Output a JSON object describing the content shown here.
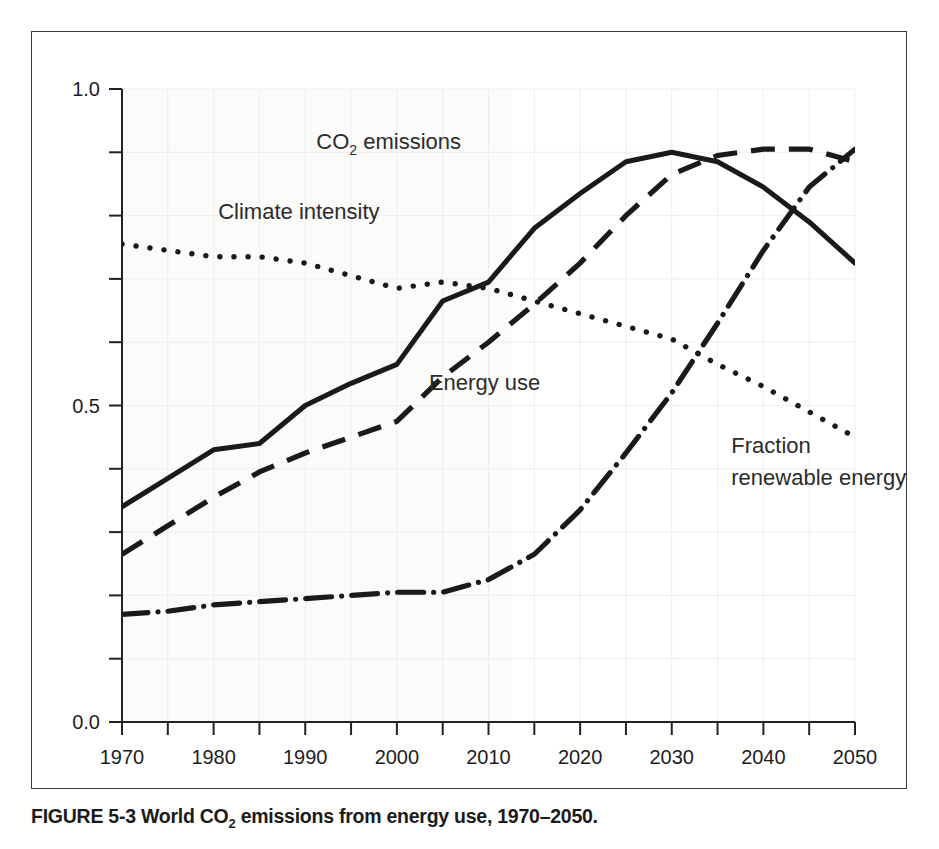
{
  "figure": {
    "caption_prefix": "FIGURE 5-3 World CO",
    "caption_sub": "2",
    "caption_suffix": " emissions from energy use, 1970–2050.",
    "caption_full": "FIGURE 5-3 World CO2 emissions from energy use, 1970–2050."
  },
  "chart_data": {
    "type": "line",
    "title": "",
    "xlabel": "",
    "ylabel": "",
    "xlim": [
      1970,
      2050
    ],
    "ylim": [
      0.0,
      1.0
    ],
    "grid": true,
    "legend_position": "inline-annotations",
    "x_ticks_major": [
      1970,
      1980,
      1990,
      2000,
      2010,
      2020,
      2030,
      2040,
      2050
    ],
    "x_tick_labels": [
      "1970",
      "1980",
      "1990",
      "2000",
      "2010",
      "2020",
      "2030",
      "2040",
      "2050"
    ],
    "x_ticks_minor": [
      1975,
      1985,
      1995,
      2005,
      2015,
      2025,
      2035,
      2045
    ],
    "y_ticks_major": [
      0.0,
      0.5,
      1.0
    ],
    "y_tick_labels": [
      "0.0",
      "0.5",
      "1.0"
    ],
    "y_ticks_minor": [
      0.1,
      0.2,
      0.3,
      0.4,
      0.6,
      0.7,
      0.8,
      0.9
    ],
    "x": [
      1970,
      1975,
      1980,
      1985,
      1990,
      1995,
      2000,
      2005,
      2010,
      2015,
      2020,
      2025,
      2030,
      2035,
      2040,
      2045,
      2050
    ],
    "series": [
      {
        "name": "CO2 emissions",
        "label": "CO₂ emissions",
        "style": "solid",
        "color": "#1a1a1a",
        "values": [
          0.34,
          0.385,
          0.43,
          0.44,
          0.5,
          0.535,
          0.565,
          0.665,
          0.695,
          0.78,
          0.835,
          0.885,
          0.9,
          0.885,
          0.845,
          0.79,
          0.725
        ]
      },
      {
        "name": "Energy use",
        "label": "Energy use",
        "style": "dashed",
        "color": "#1a1a1a",
        "values": [
          0.265,
          0.31,
          0.355,
          0.395,
          0.425,
          0.45,
          0.475,
          0.545,
          0.6,
          0.66,
          0.725,
          0.8,
          0.865,
          0.895,
          0.905,
          0.905,
          0.885
        ]
      },
      {
        "name": "Climate intensity",
        "label": "Climate intensity",
        "style": "dotted",
        "color": "#1a1a1a",
        "values": [
          0.755,
          0.745,
          0.735,
          0.735,
          0.725,
          0.705,
          0.685,
          0.695,
          0.685,
          0.665,
          0.645,
          0.625,
          0.605,
          0.565,
          0.53,
          0.49,
          0.45
        ]
      },
      {
        "name": "Fraction renewable energy",
        "label_line1": "Fraction",
        "label_line2": "renewable energy",
        "style": "dash-dot",
        "color": "#1a1a1a",
        "values": [
          0.17,
          0.175,
          0.185,
          0.19,
          0.195,
          0.2,
          0.205,
          0.205,
          0.225,
          0.265,
          0.335,
          0.425,
          0.52,
          0.63,
          0.745,
          0.845,
          0.905
        ]
      }
    ],
    "annotations": [
      {
        "text": "Climate intensity",
        "x": 1980.5,
        "y": 0.795
      },
      {
        "text": "CO₂ emissions",
        "x": 2007.0,
        "y": 0.905
      },
      {
        "text": "Energy use",
        "x": 2003.5,
        "y": 0.525
      },
      {
        "text": "Fraction",
        "x": 2036.5,
        "y": 0.425
      },
      {
        "text": "renewable energy",
        "x": 2036.5,
        "y": 0.375
      }
    ]
  }
}
